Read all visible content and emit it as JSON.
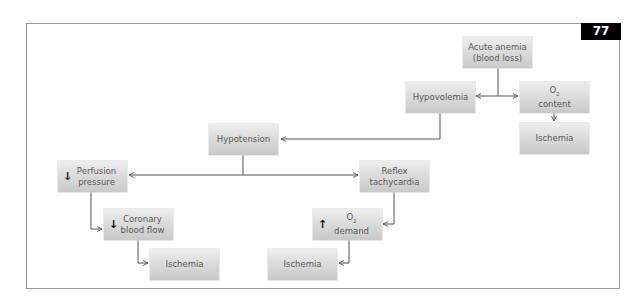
{
  "figure": {
    "number": "77"
  },
  "nodes": {
    "acute_anemia": {
      "line1": "Acute anemia",
      "line2": "(blood loss)"
    },
    "hypovolemia": {
      "line1": "Hypovolemia"
    },
    "o2_content": {
      "prefix": "O",
      "sub": "2",
      "line2": "content",
      "indicator": "down-arrow-icon"
    },
    "ischemia_right": {
      "line1": "Ischemia"
    },
    "hypotension": {
      "line1": "Hypotension"
    },
    "perfusion_pressure": {
      "line1": "Perfusion",
      "line2": "pressure",
      "indicator": "↓"
    },
    "reflex_tachycardia": {
      "line1": "Reflex",
      "line2": "tachycardia"
    },
    "coronary_blood_flow": {
      "line1": "Coronary",
      "line2": "blood flow",
      "indicator": "↓"
    },
    "o2_demand": {
      "prefix": "O",
      "sub": "2",
      "line2": "demand",
      "indicator": "↑"
    },
    "ischemia_left": {
      "line1": "Ischemia"
    },
    "ischemia_middle": {
      "line1": "Ischemia"
    }
  },
  "colors": {
    "frame": "#9a9a9a",
    "node_top": "#eeeeee",
    "node_bottom": "#c9c9c9",
    "node_text": "#5a5a5a",
    "connector": "#555555",
    "label_bg": "#000000",
    "label_text": "#ffffff"
  }
}
